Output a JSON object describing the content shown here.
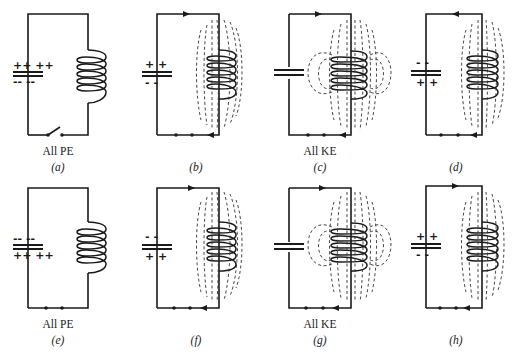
{
  "figure": {
    "panels": [
      {
        "id": "a",
        "caption": "(a)",
        "energy_label": "All PE",
        "cap_top": "++ ++",
        "cap_bottom": "-- --",
        "current": "none",
        "field": "none",
        "switch": "open"
      },
      {
        "id": "b",
        "caption": "(b)",
        "energy_label": "",
        "cap_top": "+ +",
        "cap_bottom": "- -",
        "current": "counterclockwise",
        "field": "partial"
      },
      {
        "id": "c",
        "caption": "(c)",
        "energy_label": "All KE",
        "cap_top": "",
        "cap_bottom": "",
        "current": "counterclockwise",
        "field": "full"
      },
      {
        "id": "d",
        "caption": "(d)",
        "energy_label": "",
        "cap_top": "- -",
        "cap_bottom": "+ +",
        "current": "counterclockwise",
        "field": "partial"
      },
      {
        "id": "e",
        "caption": "(e)",
        "energy_label": "All PE",
        "cap_top": "-- --",
        "cap_bottom": "++ ++",
        "current": "none",
        "field": "none"
      },
      {
        "id": "f",
        "caption": "(f)",
        "energy_label": "",
        "cap_top": "- -",
        "cap_bottom": "+ +",
        "current": "clockwise",
        "field": "partial"
      },
      {
        "id": "g",
        "caption": "(g)",
        "energy_label": "All KE",
        "cap_top": "",
        "cap_bottom": "",
        "current": "clockwise",
        "field": "full"
      },
      {
        "id": "h",
        "caption": "(h)",
        "energy_label": "",
        "cap_top": "+ +",
        "cap_bottom": "- -",
        "current": "clockwise",
        "field": "partial"
      }
    ]
  },
  "colors": {
    "ink": "#1a1a1a",
    "background": "#ffffff"
  }
}
